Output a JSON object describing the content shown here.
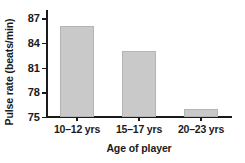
{
  "chart_data": {
    "type": "bar",
    "title": "",
    "xlabel": "Age of player",
    "ylabel": "Pulse rate (beats/min)",
    "categories": [
      "10–12 yrs",
      "15–17 yrs",
      "20–23 yrs"
    ],
    "values": [
      86,
      83,
      76
    ],
    "ylim": [
      75,
      88
    ],
    "yticks": [
      75,
      78,
      81,
      84,
      87
    ],
    "ytick_labels": [
      "75",
      "78",
      "81",
      "84",
      "87"
    ],
    "grid": false,
    "legend": null,
    "legend_position": "none",
    "bar_color": "#c9c9c9",
    "bar_edge_color": "#b4b4b4",
    "axis_color": "#1a1a1a",
    "background_color": "#ffffff",
    "note": "y-axis starts at 75, not zero"
  }
}
